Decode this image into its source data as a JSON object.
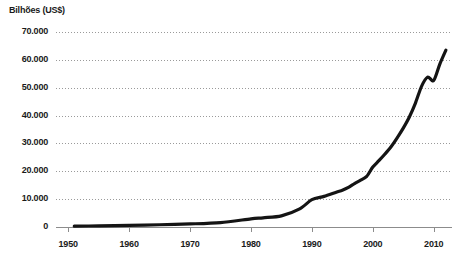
{
  "chart_data": {
    "type": "line",
    "title": "",
    "ylabel": "Bilhões (US$)",
    "xlabel": "",
    "ylim": [
      0,
      70000
    ],
    "xlim": [
      1948,
      2013
    ],
    "grid": true,
    "legend": false,
    "y_ticks": [
      {
        "value": 70000,
        "label": "70.000"
      },
      {
        "value": 60000,
        "label": "60.000"
      },
      {
        "value": 50000,
        "label": "50.000"
      },
      {
        "value": 40000,
        "label": "40.000"
      },
      {
        "value": 30000,
        "label": "30.000"
      },
      {
        "value": 20000,
        "label": "20.000"
      },
      {
        "value": 10000,
        "label": "10.000"
      },
      {
        "value": 0,
        "label": "0"
      }
    ],
    "x_ticks": [
      {
        "value": 1950,
        "label": "1950"
      },
      {
        "value": 1960,
        "label": "1960"
      },
      {
        "value": 1970,
        "label": "1970"
      },
      {
        "value": 1980,
        "label": "1980"
      },
      {
        "value": 1990,
        "label": "1990"
      },
      {
        "value": 2000,
        "label": "2000"
      },
      {
        "value": 2010,
        "label": "2010"
      }
    ],
    "series": [
      {
        "name": "Bilhões (US$)",
        "color": "#141414",
        "x": [
          1951,
          1955,
          1960,
          1965,
          1970,
          1975,
          1980,
          1982,
          1985,
          1988,
          1990,
          1992,
          1994,
          1995,
          1996,
          1997,
          1998,
          1999,
          2000,
          2001,
          2002,
          2003,
          2004,
          2005,
          2006,
          2007,
          2008,
          2009,
          2010,
          2011,
          2012
        ],
        "y": [
          300,
          400,
          600,
          800,
          1100,
          1600,
          2900,
          3300,
          4000,
          6500,
          9800,
          11000,
          12500,
          13200,
          14200,
          15600,
          16800,
          18200,
          21500,
          23800,
          26200,
          28800,
          32000,
          35500,
          39500,
          44500,
          50500,
          53800,
          52600,
          58500,
          63500
        ]
      }
    ]
  },
  "plot_geometry": {
    "left": 56,
    "right": 452,
    "top": 32,
    "bottom": 227,
    "gridline_color": "#9a9a9a",
    "axis_color": "#8c8c8c",
    "line_width": 3.2
  }
}
